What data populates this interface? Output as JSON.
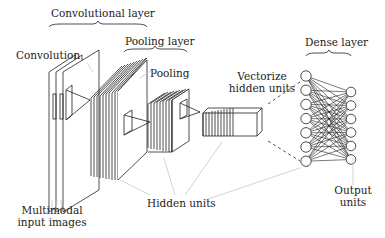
{
  "diagram": {
    "type": "cnn-architecture",
    "labels": {
      "convolutional_layer": "Convolutional layer",
      "pooling_layer": "Pooling layer",
      "convolution": "Convolution",
      "pooling": "Pooling",
      "vectorize_line1": "Vectorize",
      "vectorize_line2": "hidden units",
      "dense_layer": "Dense layer",
      "multimodal_line1": "Multimodal",
      "multimodal_line2": "input images",
      "hidden_units": "Hidden units",
      "output_line1": "Output",
      "output_line2": "units"
    },
    "dense_layer": {
      "input_nodes": 7,
      "output_nodes": 6
    },
    "colors": {
      "stroke": "#222222",
      "leader_line": "#c8c8c8",
      "background": "#ffffff"
    }
  }
}
